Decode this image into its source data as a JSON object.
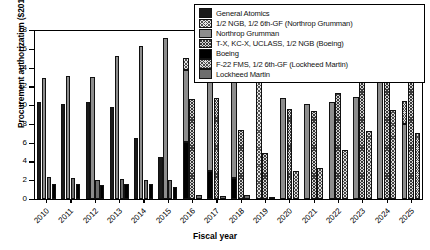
{
  "chart_data": {
    "type": "bar",
    "title": "",
    "xlabel": "Fiscal year",
    "ylabel": "Procurement authorization ($2011B)",
    "ylim": [
      0,
      18
    ],
    "yticks": [
      0,
      2,
      4,
      6,
      8,
      10,
      12,
      14,
      16,
      18
    ],
    "grid": false,
    "legend_position": "top-right",
    "categories": [
      "2010",
      "2011",
      "2012",
      "2013",
      "2014",
      "2015",
      "2016",
      "2017",
      "2018",
      "2019",
      "2020",
      "2021",
      "2022",
      "2023",
      "2024",
      "2025"
    ],
    "series": [
      {
        "name": "General Atomics",
        "fill": "solid-dark-gray",
        "values": [
          10.3,
          10.1,
          10.3,
          9.8,
          0,
          0,
          0,
          0,
          0,
          0,
          0,
          0,
          0,
          0,
          0,
          0
        ]
      },
      {
        "name": "1/2 NGB, 1/2 6th-GF (Northrop Grumman)",
        "fill": "checkered-light",
        "values": [
          0,
          0,
          0,
          0,
          0,
          0,
          1.3,
          2.2,
          2.3,
          5.2,
          0,
          0,
          0,
          0,
          0,
          0
        ]
      },
      {
        "name": "Northrop Grumman",
        "fill": "solid-medium-gray",
        "values": [
          12.9,
          13.15,
          12.95,
          15.25,
          16.3,
          17.1,
          13.7,
          13.4,
          12.85,
          0,
          10.8,
          10.1,
          10.3,
          10.9,
          13.2,
          8.0
        ]
      },
      {
        "name": "T-X, KC-X, UCLASS, 1/2 NGB (Boeing)",
        "fill": "checkered-dark",
        "values": [
          0,
          0,
          0,
          0,
          0,
          0,
          10.7,
          10.75,
          7.3,
          4.9,
          9.6,
          9.4,
          11.3,
          13.0,
          13.15,
          12.7
        ]
      },
      {
        "name": "Boeing",
        "fill": "solid-black",
        "values": [
          1.6,
          1.55,
          1.5,
          1.65,
          1.55,
          1.3,
          0.45,
          0.35,
          0.45,
          0.2,
          0.25,
          3.3,
          0,
          0,
          0,
          0
        ]
      },
      {
        "name": "F-22 FMS, 1/2 6th-GF (Lockheed Martin)",
        "fill": "checkered-mid",
        "values": [
          0,
          0,
          0,
          0,
          0,
          0,
          0,
          0,
          0,
          0,
          7.6,
          6.0,
          7.7,
          9.5,
          10.4,
          9.5
        ]
      },
      {
        "name": "Lockheed Martin",
        "fill": "solid-gray",
        "values": [
          2.3,
          2.2,
          2.0,
          2.15,
          2.05,
          2.0,
          0,
          0,
          0,
          0,
          0,
          0,
          0,
          0,
          0,
          0
        ]
      }
    ]
  },
  "legend": {
    "items": [
      {
        "label": "General Atomics",
        "swatch": "f-ga"
      },
      {
        "label": "1/2 NGB, 1/2 6th-GF (Northrop Grumman)",
        "swatch": "f-ngb"
      },
      {
        "label": "Northrop Grumman",
        "swatch": "f-ng"
      },
      {
        "label": "T-X, KC-X, UCLASS, 1/2 NGB (Boeing)",
        "swatch": "f-tx"
      },
      {
        "label": "Boeing",
        "swatch": "f-boe"
      },
      {
        "label": "F-22 FMS, 1/2 6th-GF (Lockheed Martin)",
        "swatch": "f-f22"
      },
      {
        "label": "Lockheed Martin",
        "swatch": "f-lm"
      }
    ]
  },
  "bars": [
    {
      "year": "2010",
      "stacks": [
        [
          {
            "c": "f-ga",
            "v": 10.3
          }
        ],
        [
          {
            "c": "f-ng",
            "v": 12.9
          }
        ],
        [
          {
            "c": "f-lm",
            "v": 2.3
          }
        ],
        [
          {
            "c": "f-boe",
            "v": 1.6
          }
        ]
      ]
    },
    {
      "year": "2011",
      "stacks": [
        [
          {
            "c": "f-ga",
            "v": 10.1
          }
        ],
        [
          {
            "c": "f-ng",
            "v": 13.15
          }
        ],
        [
          {
            "c": "f-lm",
            "v": 2.2
          }
        ],
        [
          {
            "c": "f-boe",
            "v": 1.55
          }
        ]
      ]
    },
    {
      "year": "2012",
      "stacks": [
        [
          {
            "c": "f-ga",
            "v": 10.3
          }
        ],
        [
          {
            "c": "f-ng",
            "v": 12.95
          }
        ],
        [
          {
            "c": "f-lm",
            "v": 2.0
          }
        ],
        [
          {
            "c": "f-boe",
            "v": 1.5
          }
        ]
      ]
    },
    {
      "year": "2013",
      "stacks": [
        [
          {
            "c": "f-ga",
            "v": 9.8
          }
        ],
        [
          {
            "c": "f-ng",
            "v": 15.25
          }
        ],
        [
          {
            "c": "f-lm",
            "v": 2.15
          }
        ],
        [
          {
            "c": "f-boe",
            "v": 1.65
          }
        ]
      ]
    },
    {
      "year": "2014",
      "stacks": [
        [
          {
            "c": "f-ga",
            "v": 6.5
          }
        ],
        [
          {
            "c": "f-ng",
            "v": 16.3
          }
        ],
        [
          {
            "c": "f-lm",
            "v": 2.05
          }
        ],
        [
          {
            "c": "f-boe",
            "v": 1.55
          }
        ]
      ]
    },
    {
      "year": "2015",
      "stacks": [
        [
          {
            "c": "f-ga",
            "v": 4.5
          }
        ],
        [
          {
            "c": "f-ng",
            "v": 17.1
          }
        ],
        [
          {
            "c": "f-lm",
            "v": 2.0
          }
        ],
        [
          {
            "c": "f-boe",
            "v": 1.3
          }
        ]
      ]
    },
    {
      "year": "2016",
      "stacks": [
        [
          {
            "c": "f-boe",
            "v": 6.1
          },
          {
            "c": "f-ng",
            "v": 7.6
          },
          {
            "c": "f-ngb",
            "v": 1.3
          }
        ],
        [
          {
            "c": "f-tx",
            "v": 10.7
          }
        ],
        [
          {
            "c": "f-lm",
            "v": 0.45
          }
        ]
      ]
    },
    {
      "year": "2017",
      "stacks": [
        [
          {
            "c": "f-boe",
            "v": 3.0
          },
          {
            "c": "f-ng",
            "v": 10.4
          },
          {
            "c": "f-ngb",
            "v": 2.2
          }
        ],
        [
          {
            "c": "f-tx",
            "v": 10.75
          }
        ],
        [
          {
            "c": "f-lm",
            "v": 0.35
          }
        ]
      ]
    },
    {
      "year": "2018",
      "stacks": [
        [
          {
            "c": "f-boe",
            "v": 2.2
          },
          {
            "c": "f-ng",
            "v": 10.65
          },
          {
            "c": "f-ngb",
            "v": 2.3
          }
        ],
        [
          {
            "c": "f-tx",
            "v": 7.3
          }
        ],
        [
          {
            "c": "f-lm",
            "v": 0.45
          }
        ]
      ]
    },
    {
      "year": "2019",
      "stacks": [
        [
          {
            "c": "f-ngb",
            "v": 15.2
          }
        ],
        [
          {
            "c": "f-tx",
            "v": 4.9
          }
        ],
        [
          {
            "c": "f-lm",
            "v": 0.2
          }
        ]
      ]
    },
    {
      "year": "2020",
      "stacks": [
        [
          {
            "c": "f-ng",
            "v": 10.8
          }
        ],
        [
          {
            "c": "f-tx",
            "v": 9.6
          }
        ],
        [
          {
            "c": "f-f22",
            "v": 3.0
          }
        ]
      ]
    },
    {
      "year": "2021",
      "stacks": [
        [
          {
            "c": "f-ng",
            "v": 10.1
          }
        ],
        [
          {
            "c": "f-tx",
            "v": 9.4
          }
        ],
        [
          {
            "c": "f-f22",
            "v": 3.3
          }
        ]
      ]
    },
    {
      "year": "2022",
      "stacks": [
        [
          {
            "c": "f-ng",
            "v": 10.3
          }
        ],
        [
          {
            "c": "f-tx",
            "v": 11.3
          }
        ],
        [
          {
            "c": "f-f22",
            "v": 5.2
          }
        ]
      ]
    },
    {
      "year": "2023",
      "stacks": [
        [
          {
            "c": "f-ng",
            "v": 10.9
          }
        ],
        [
          {
            "c": "f-tx",
            "v": 13.0
          }
        ],
        [
          {
            "c": "f-f22",
            "v": 7.2
          }
        ]
      ]
    },
    {
      "year": "2024",
      "stacks": [
        [
          {
            "c": "f-ng",
            "v": 13.2
          }
        ],
        [
          {
            "c": "f-tx",
            "v": 13.15
          }
        ],
        [
          {
            "c": "f-f22",
            "v": 9.5
          }
        ]
      ]
    },
    {
      "year": "2025",
      "stacks": [
        [
          {
            "c": "f-ng",
            "v": 8.0
          },
          {
            "c": "f-f22",
            "v": 2.4
          }
        ],
        [
          {
            "c": "f-tx",
            "v": 12.7
          }
        ],
        [
          {
            "c": "f-f22",
            "v": 7.0
          }
        ]
      ]
    }
  ]
}
